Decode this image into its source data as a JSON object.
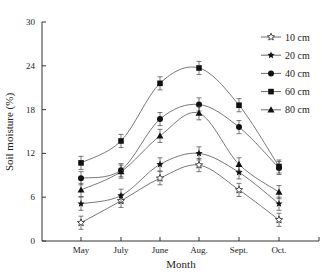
{
  "chart_data": {
    "type": "line",
    "title": "",
    "xlabel": "Month",
    "ylabel": "Soil moisture (%)",
    "categories": [
      "May",
      "July",
      "June",
      "Aug.",
      "Sept.",
      "Oct."
    ],
    "ylim": [
      0,
      30
    ],
    "yticks": [
      0,
      6,
      12,
      18,
      24,
      30
    ],
    "grid": false,
    "legend_position": "upper right",
    "series": [
      {
        "name": "10 cm",
        "marker": "open-star",
        "values": [
          2.5,
          5.5,
          8.6,
          10.4,
          7.0,
          2.9
        ]
      },
      {
        "name": "20 cm",
        "marker": "filled-star",
        "values": [
          5.1,
          6.2,
          10.5,
          12.0,
          9.4,
          5.1
        ]
      },
      {
        "name": "40 cm",
        "marker": "filled-circle",
        "values": [
          8.6,
          9.7,
          16.7,
          18.7,
          15.6,
          10.0
        ]
      },
      {
        "name": "60 cm",
        "marker": "filled-square",
        "values": [
          10.7,
          13.7,
          21.6,
          23.7,
          18.6,
          10.2
        ]
      },
      {
        "name": "80 cm",
        "marker": "filled-triangle",
        "values": [
          7.0,
          9.5,
          14.4,
          17.5,
          10.5,
          6.7
        ]
      }
    ],
    "error_bar_half": 0.9
  }
}
